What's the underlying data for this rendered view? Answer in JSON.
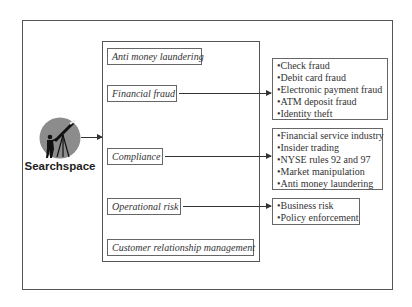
{
  "source": {
    "name": "Searchspace",
    "icon": "telescope-observer-icon"
  },
  "categories": [
    {
      "label": "Anti money laundering"
    },
    {
      "label": "Financial fraud"
    },
    {
      "label": "Compliance"
    },
    {
      "label": "Operational risk"
    },
    {
      "label": "Customer relationship management"
    }
  ],
  "details": {
    "financial_fraud": [
      "Check fraud",
      "Debit card fraud",
      "Electronic payment fraud",
      "ATM deposit fraud",
      "Identity theft"
    ],
    "compliance": [
      "Financial service industry",
      "Insider trading",
      "NYSE rules 92 and 97",
      "Market manipulation",
      "Anti money laundering"
    ],
    "operational_risk": [
      "Business risk",
      "Policy enforcement"
    ]
  },
  "colors": {
    "line": "#333333",
    "border": "#666666",
    "logo_circle": "#8c8c8c"
  }
}
